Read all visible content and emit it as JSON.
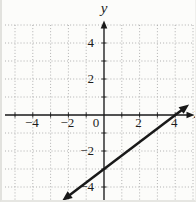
{
  "figure": {
    "background": "#fcfcfa",
    "ink_color": "#191919",
    "grid_color": "#adadad"
  },
  "chart_data": {
    "type": "line",
    "title": "",
    "xlabel": "x",
    "ylabel": "y",
    "xlim": [
      -5,
      5
    ],
    "ylim": [
      -5,
      5
    ],
    "grid": "on",
    "grid_step": 1,
    "legend": "none",
    "x_tick_values": [
      -4,
      -2,
      0,
      2,
      4
    ],
    "x_tick_labels": [
      "−4",
      "−2",
      "0",
      "2",
      "4"
    ],
    "y_tick_values": [
      4,
      2,
      -2,
      -4
    ],
    "y_tick_labels": [
      "4",
      "2",
      "−2",
      "−4"
    ],
    "axis_arrows": {
      "x": "right",
      "y": "up"
    },
    "series": [
      {
        "name": "graphed-line",
        "slope": 0.75,
        "y_intercept": -3,
        "x_intercept": 4,
        "points": [
          [
            0,
            -3
          ],
          [
            4,
            0
          ]
        ],
        "x_range_drawn": [
          -2.35,
          4.78
        ],
        "arrow_both_ends": true
      }
    ]
  }
}
